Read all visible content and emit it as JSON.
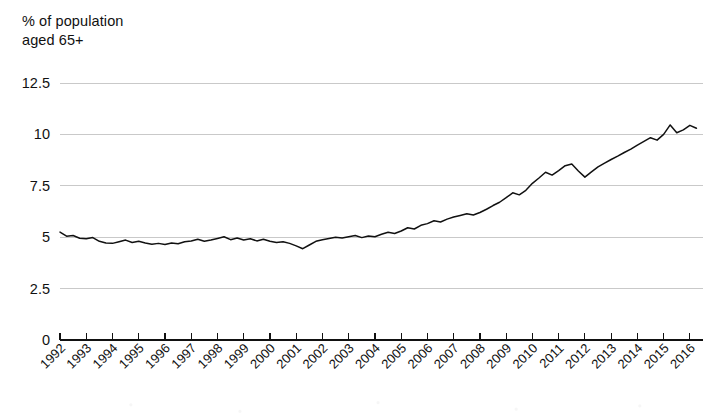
{
  "chart_data": {
    "type": "line",
    "title": "",
    "ylabel": "% of population\naged 65+",
    "xlabel": "",
    "ylim": [
      0,
      12.5
    ],
    "yticks": [
      0,
      2.5,
      5,
      7.5,
      10,
      12.5
    ],
    "ytick_labels": [
      "0",
      "2.5",
      "5",
      "7.5",
      "10",
      "12.5"
    ],
    "grid": true,
    "legend": "none",
    "xlim": [
      1992,
      2016.5
    ],
    "categories": [
      "1992",
      "1993",
      "1994",
      "1995",
      "1996",
      "1997",
      "1998",
      "1999",
      "2000",
      "2001",
      "2002",
      "2003",
      "2004",
      "2005",
      "2006",
      "2007",
      "2008",
      "2009",
      "2010",
      "2011",
      "2012",
      "2013",
      "2014",
      "2015",
      "2016"
    ],
    "series": [
      {
        "name": "% of population aged 65+",
        "x": [
          1992.0,
          1992.25,
          1992.5,
          1992.75,
          1993.0,
          1993.25,
          1993.5,
          1993.75,
          1994.0,
          1994.25,
          1994.5,
          1994.75,
          1995.0,
          1995.25,
          1995.5,
          1995.75,
          1996.0,
          1996.25,
          1996.5,
          1996.75,
          1997.0,
          1997.25,
          1997.5,
          1997.75,
          1998.0,
          1998.25,
          1998.5,
          1998.75,
          1999.0,
          1999.25,
          1999.5,
          1999.75,
          2000.0,
          2000.25,
          2000.5,
          2000.75,
          2001.0,
          2001.25,
          2001.5,
          2001.75,
          2002.0,
          2002.25,
          2002.5,
          2002.75,
          2003.0,
          2003.25,
          2003.5,
          2003.75,
          2004.0,
          2004.25,
          2004.5,
          2004.75,
          2005.0,
          2005.25,
          2005.5,
          2005.75,
          2006.0,
          2006.25,
          2006.5,
          2006.75,
          2007.0,
          2007.25,
          2007.5,
          2007.75,
          2008.0,
          2008.25,
          2008.5,
          2008.75,
          2009.0,
          2009.25,
          2009.5,
          2009.75,
          2010.0,
          2010.25,
          2010.5,
          2010.75,
          2011.0,
          2011.25,
          2011.5,
          2011.75,
          2012.0,
          2012.25,
          2012.5,
          2012.75,
          2013.0,
          2013.25,
          2013.5,
          2013.75,
          2014.0,
          2014.25,
          2014.5,
          2014.75,
          2015.0,
          2015.25,
          2015.5,
          2015.75,
          2016.0,
          2016.25
        ],
        "values": [
          5.25,
          5.05,
          5.08,
          4.95,
          4.92,
          4.98,
          4.8,
          4.72,
          4.7,
          4.78,
          4.86,
          4.74,
          4.8,
          4.72,
          4.66,
          4.7,
          4.64,
          4.72,
          4.68,
          4.78,
          4.82,
          4.9,
          4.8,
          4.86,
          4.94,
          5.02,
          4.88,
          4.96,
          4.86,
          4.92,
          4.82,
          4.9,
          4.8,
          4.74,
          4.78,
          4.7,
          4.58,
          4.44,
          4.62,
          4.8,
          4.88,
          4.94,
          5.0,
          4.96,
          5.02,
          5.08,
          4.98,
          5.06,
          5.02,
          5.14,
          5.24,
          5.18,
          5.3,
          5.46,
          5.4,
          5.58,
          5.66,
          5.8,
          5.74,
          5.88,
          5.98,
          6.06,
          6.14,
          6.08,
          6.2,
          6.36,
          6.54,
          6.7,
          6.92,
          7.16,
          7.06,
          7.28,
          7.62,
          7.88,
          8.16,
          8.02,
          8.24,
          8.48,
          8.56,
          8.22,
          7.92,
          8.18,
          8.42,
          8.6,
          8.78,
          8.94,
          9.12,
          9.28,
          9.48,
          9.66,
          9.84,
          9.72,
          10.0,
          10.46,
          10.08,
          10.22,
          10.44,
          10.3
        ]
      }
    ]
  },
  "axes": {
    "y_label_line1": "% of population",
    "y_label_line2": "aged 65+"
  }
}
